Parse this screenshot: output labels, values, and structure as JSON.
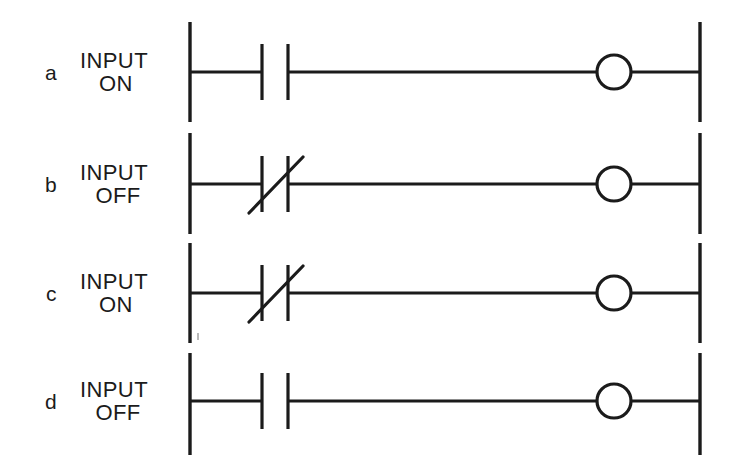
{
  "diagram": {
    "type": "ladder-logic-diagram",
    "background_color": "#ffffff",
    "line_color": "#1b1b1b",
    "rail": {
      "left_x": 190,
      "right_x": 700
    },
    "geometry": {
      "contact_bar_left_x": 262,
      "contact_bar_right_x": 288,
      "contact_bar_half_height": 28,
      "coil_center_x": 614,
      "coil_radius": 17,
      "rail_extend_above": 50,
      "rail_extend_below": 54
    },
    "rows": [
      {
        "id": "a",
        "label_id": "a",
        "label_line1": "INPUT",
        "label_line2": "ON",
        "input_state": "ON",
        "contact_type": "normally-open",
        "contact_symbol": "-| |-",
        "coil_state": "energized",
        "rung_y": 72
      },
      {
        "id": "b",
        "label_id": "b",
        "label_line1": "INPUT",
        "label_line2": "OFF",
        "input_state": "OFF",
        "contact_type": "normally-closed",
        "contact_symbol": "-|/|-",
        "coil_state": "energized",
        "rung_y": 184
      },
      {
        "id": "c",
        "label_id": "c",
        "label_line1": "INPUT",
        "label_line2": "ON",
        "input_state": "ON",
        "contact_type": "normally-closed",
        "contact_symbol": "-|/|-",
        "coil_state": "de-energized",
        "rung_y": 293
      },
      {
        "id": "d",
        "label_id": "d",
        "label_line1": "INPUT",
        "label_line2": "OFF",
        "input_state": "OFF",
        "contact_type": "normally-open",
        "contact_symbol": "-| |-",
        "coil_state": "de-energized",
        "rung_y": 401
      }
    ]
  }
}
